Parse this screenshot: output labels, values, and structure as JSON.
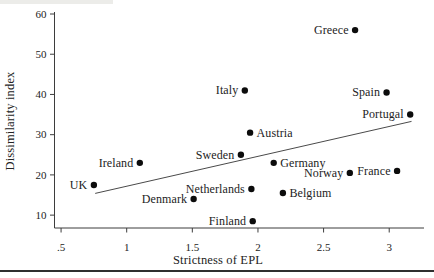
{
  "figure": {
    "background": "#ffffff",
    "ink_color": "#232323",
    "axis_color": "#3d3d3d",
    "marker_color": "#0c0c0c",
    "rule_color": "#2f2f2f",
    "artifact_color": "#ecece9"
  },
  "chart_data": {
    "type": "scatter",
    "title": "",
    "xlabel": "Strictness of EPL",
    "ylabel": "Dissimilarity index",
    "xlim": [
      0.45,
      3.265
    ],
    "ylim": [
      6.8,
      60
    ],
    "grid": false,
    "legend": null,
    "x_ticks": [
      {
        "value": 0.5,
        "label": ".5"
      },
      {
        "value": 1,
        "label": "1"
      },
      {
        "value": 1.5,
        "label": "1.5"
      },
      {
        "value": 2,
        "label": "2"
      },
      {
        "value": 2.5,
        "label": "2.5"
      },
      {
        "value": 3,
        "label": "3"
      }
    ],
    "y_ticks": [
      {
        "value": 10,
        "label": "10"
      },
      {
        "value": 20,
        "label": "20"
      },
      {
        "value": 30,
        "label": "30"
      },
      {
        "value": 40,
        "label": "40"
      },
      {
        "value": 50,
        "label": "50"
      },
      {
        "value": 60,
        "label": "60"
      }
    ],
    "points": [
      {
        "label": "UK",
        "x": 0.75,
        "y": 17.5,
        "label_side": "left"
      },
      {
        "label": "Ireland",
        "x": 1.1,
        "y": 23,
        "label_side": "left"
      },
      {
        "label": "Denmark",
        "x": 1.51,
        "y": 14,
        "label_side": "left"
      },
      {
        "label": "Finland",
        "x": 1.96,
        "y": 8.5,
        "label_side": "left"
      },
      {
        "label": "Netherlands",
        "x": 1.95,
        "y": 16.5,
        "label_side": "left"
      },
      {
        "label": "Sweden",
        "x": 1.87,
        "y": 25,
        "label_side": "left"
      },
      {
        "label": "Italy",
        "x": 1.9,
        "y": 41,
        "label_side": "left"
      },
      {
        "label": "Austria",
        "x": 1.94,
        "y": 30.5,
        "label_side": "right"
      },
      {
        "label": "Germany",
        "x": 2.12,
        "y": 23,
        "label_side": "right"
      },
      {
        "label": "Belgium",
        "x": 2.19,
        "y": 15.5,
        "label_side": "right"
      },
      {
        "label": "Norway",
        "x": 2.7,
        "y": 20.5,
        "label_side": "left"
      },
      {
        "label": "France",
        "x": 3.06,
        "y": 21,
        "label_side": "left"
      },
      {
        "label": "Greece",
        "x": 2.74,
        "y": 56,
        "label_side": "left"
      },
      {
        "label": "Spain",
        "x": 2.98,
        "y": 40.5,
        "label_side": "left"
      },
      {
        "label": "Portugal",
        "x": 3.16,
        "y": 35,
        "label_side": "left"
      }
    ],
    "trend_line": {
      "x1": 0.76,
      "y1": 15.4,
      "x2": 3.17,
      "y2": 33.3
    }
  }
}
